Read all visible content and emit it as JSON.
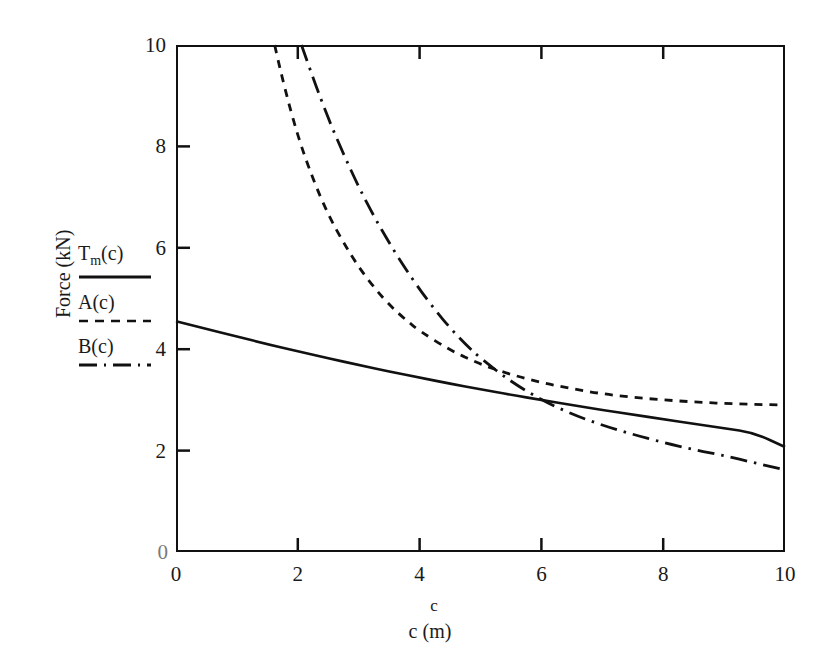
{
  "chart_data": {
    "type": "line",
    "title": "",
    "xlabel": "c (m)",
    "xlabel_sup": "c",
    "ylabel": "Force (kN)",
    "xlim": [
      0,
      10
    ],
    "ylim": [
      0,
      10
    ],
    "xticks": [
      "0",
      "2",
      "4",
      "6",
      "8",
      "10"
    ],
    "yticks": [
      "0",
      "2",
      "4",
      "6",
      "8",
      "10"
    ],
    "xtick_values": [
      0,
      2,
      4,
      6,
      8,
      10
    ],
    "ytick_values": [
      0,
      2,
      4,
      6,
      8,
      10
    ],
    "grid": false,
    "legend_position": "left-outside",
    "axis_color": "#111111",
    "series": [
      {
        "name": "T_m(c)",
        "label": "T",
        "label_sub": "m",
        "label_tail": "(c)",
        "style": "solid",
        "color": "#111111",
        "x": [
          0,
          0.5,
          1,
          1.5,
          2,
          2.5,
          3,
          3.5,
          4,
          4.5,
          5,
          5.5,
          6,
          6.5,
          7,
          7.5,
          8,
          8.5,
          9,
          9.5,
          10
        ],
        "y": [
          4.55,
          4.4,
          4.25,
          4.1,
          3.96,
          3.82,
          3.69,
          3.56,
          3.44,
          3.32,
          3.21,
          3.1,
          3.0,
          2.9,
          2.8,
          2.71,
          2.62,
          2.53,
          2.44,
          2.35,
          2.07
        ]
      },
      {
        "name": "A(c)",
        "label": "A(c)",
        "style": "dashed",
        "color": "#111111",
        "x": [
          1.62,
          1.75,
          2.0,
          2.25,
          2.5,
          2.75,
          3.0,
          3.25,
          3.5,
          3.75,
          4.0,
          4.5,
          5.0,
          5.5,
          6.0,
          6.5,
          7.0,
          7.5,
          8.0,
          8.5,
          9.0,
          9.5,
          10
        ],
        "y": [
          10.0,
          9.3,
          8.2,
          7.35,
          6.65,
          6.1,
          5.62,
          5.22,
          4.88,
          4.6,
          4.36,
          3.98,
          3.7,
          3.5,
          3.34,
          3.22,
          3.12,
          3.05,
          3.0,
          2.96,
          2.93,
          2.91,
          2.9
        ]
      },
      {
        "name": "B(c)",
        "label": "B(c)",
        "style": "dash-dot",
        "color": "#111111",
        "x": [
          2.06,
          2.25,
          2.5,
          2.75,
          3.0,
          3.25,
          3.5,
          3.75,
          4.0,
          4.25,
          4.5,
          4.75,
          5.0,
          5.5,
          6.0,
          6.5,
          7.0,
          7.5,
          8.0,
          8.5,
          9.0,
          9.5,
          10
        ],
        "y": [
          10.0,
          9.35,
          8.55,
          7.85,
          7.2,
          6.62,
          6.1,
          5.62,
          5.18,
          4.78,
          4.42,
          4.1,
          3.82,
          3.36,
          3.0,
          2.72,
          2.5,
          2.32,
          2.16,
          2.02,
          1.9,
          1.76,
          1.62
        ]
      }
    ]
  },
  "legend": {
    "items": [
      {
        "text_main": "T",
        "text_sub": "m",
        "text_tail": "(c)",
        "style": "solid"
      },
      {
        "text_main": "A(c)",
        "text_sub": "",
        "text_tail": "",
        "style": "dashed"
      },
      {
        "text_main": "B(c)",
        "text_sub": "",
        "text_tail": "",
        "style": "dash-dot"
      }
    ]
  },
  "axis_zero_marks": {
    "y_origin_faint": "0",
    "x_origin": "0"
  }
}
